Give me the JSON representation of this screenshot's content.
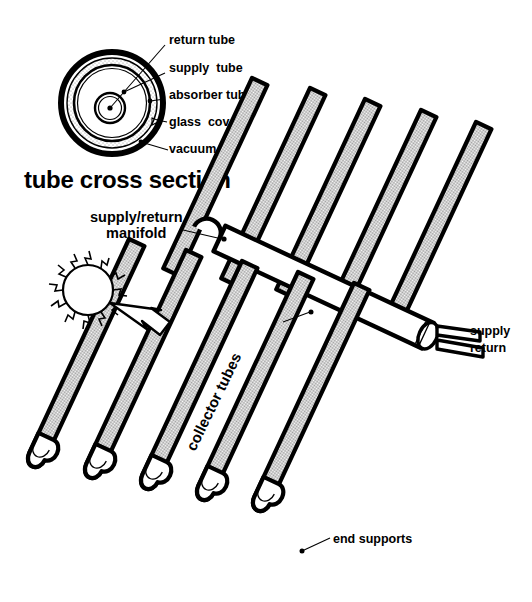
{
  "figure": {
    "title_section": "tube cross section"
  },
  "cross_section": {
    "caption": "tube cross section",
    "callouts": [
      {
        "id": "return-tube",
        "label": "return tube"
      },
      {
        "id": "supply-tube",
        "label": "supply  tube"
      },
      {
        "id": "absorber-tube",
        "label": "absorber tube"
      },
      {
        "id": "glass-cover",
        "label": "glass  cover"
      },
      {
        "id": "vacuum",
        "label": "vacuum"
      }
    ]
  },
  "assembly": {
    "callouts": [
      {
        "id": "manifold-line1",
        "label": "supply/return"
      },
      {
        "id": "manifold-line2",
        "label": "manifold"
      },
      {
        "id": "collector-tubes",
        "label": "collector tubes"
      },
      {
        "id": "supply-outlet",
        "label": "supply"
      },
      {
        "id": "return-outlet",
        "label": "return"
      },
      {
        "id": "end-supports",
        "label": "end supports"
      }
    ],
    "tube_count": 5
  },
  "icons": {
    "sun": "sun-icon",
    "arrow": "arrow-icon"
  },
  "colors": {
    "ink": "#000000",
    "paper": "#ffffff",
    "tube_fill": "#c9c9c9",
    "stipple": "#d8d8d8"
  }
}
